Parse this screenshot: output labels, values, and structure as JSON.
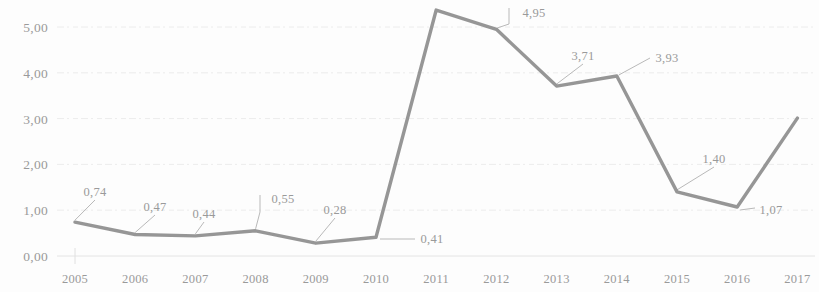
{
  "chart_data": {
    "type": "line",
    "title": "",
    "subtitle": "",
    "xlabel": "",
    "ylabel": "",
    "categories": [
      "2005",
      "2006",
      "2007",
      "2008",
      "2009",
      "2010",
      "2011",
      "2012",
      "2013",
      "2014",
      "2015",
      "2016",
      "2017"
    ],
    "values": [
      0.74,
      0.47,
      0.44,
      0.55,
      0.28,
      0.41,
      5.37,
      4.95,
      3.71,
      3.93,
      1.4,
      1.07,
      3.01
    ],
    "point_labels": [
      "0,74",
      "0,47",
      "0,44",
      "0,55",
      "0,28",
      "0,41",
      "",
      "4,95",
      "3,71",
      "3,93",
      "1,40",
      "1,07",
      ""
    ],
    "ytick_labels": [
      "0,00",
      "1,00",
      "2,00",
      "3,00",
      "4,00",
      "5,00"
    ],
    "ytick_values": [
      0,
      1,
      2,
      3,
      4,
      5
    ],
    "ylim": [
      0,
      5.6
    ],
    "grid": true,
    "legend": "none",
    "series": [
      {
        "name": "series-1",
        "color": "#8d8d8d",
        "values": [
          0.74,
          0.47,
          0.44,
          0.55,
          0.28,
          0.41,
          5.37,
          4.95,
          3.71,
          3.93,
          1.4,
          1.07,
          3.01
        ]
      }
    ]
  },
  "axes": {
    "y_ticks": [
      {
        "label": "0,00",
        "value": 0
      },
      {
        "label": "1,00",
        "value": 1
      },
      {
        "label": "2,00",
        "value": 2
      },
      {
        "label": "3,00",
        "value": 3
      },
      {
        "label": "4,00",
        "value": 4
      },
      {
        "label": "5,00",
        "value": 5
      }
    ],
    "x_ticks": [
      {
        "label": "2005"
      },
      {
        "label": "2006"
      },
      {
        "label": "2007"
      },
      {
        "label": "2008"
      },
      {
        "label": "2009"
      },
      {
        "label": "2010"
      },
      {
        "label": "2011"
      },
      {
        "label": "2012"
      },
      {
        "label": "2013"
      },
      {
        "label": "2014"
      },
      {
        "label": "2015"
      },
      {
        "label": "2016"
      },
      {
        "label": "2017"
      }
    ]
  },
  "data_labels": [
    {
      "text": "0,74",
      "x": 95,
      "y": 196
    },
    {
      "text": "0,47",
      "x": 155,
      "y": 211
    },
    {
      "text": "0,44",
      "x": 204,
      "y": 218
    },
    {
      "text": "0,55",
      "x": 283,
      "y": 203
    },
    {
      "text": "0,28",
      "x": 335,
      "y": 214
    },
    {
      "text": "0,41",
      "x": 432,
      "y": 243
    },
    {
      "text": "4,95",
      "x": 534,
      "y": 17
    },
    {
      "text": "3,71",
      "x": 583,
      "y": 60
    },
    {
      "text": "3,93",
      "x": 667,
      "y": 62
    },
    {
      "text": "1,40",
      "x": 714,
      "y": 163
    },
    {
      "text": "1,07",
      "x": 771,
      "y": 214
    }
  ],
  "colors": {
    "line": "#8d8d8d",
    "grid": "#ececec",
    "text": "#9a9a9a",
    "background": "#fdfdfd"
  }
}
